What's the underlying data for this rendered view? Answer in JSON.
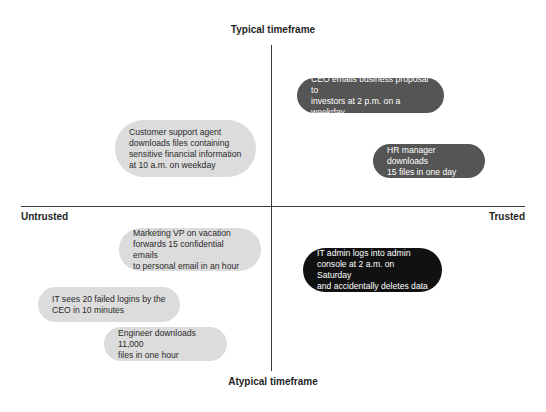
{
  "axes": {
    "top": "Typical timeframe",
    "bottom": "Atypical timeframe",
    "left": "Untrusted",
    "right": "Trusted"
  },
  "colors": {
    "light_pill": "#dcdcdc",
    "mid_pill": "#555555",
    "dark_pill": "#111111",
    "axis_line": "#3a3a3a"
  },
  "items": [
    {
      "text": "CEO emails business proposal to\ninvestors at 2 p.m. on a weekday",
      "quadrant": "typical-trusted",
      "shade": "mid"
    },
    {
      "text": "Customer support agent\ndownloads files containing\nsensitive financial information\nat 10 a.m. on weekday",
      "quadrant": "typical-untrusted",
      "shade": "light"
    },
    {
      "text": "HR manager downloads\n15 files in one day",
      "quadrant": "typical-trusted",
      "shade": "mid"
    },
    {
      "text": "Marketing VP on vacation\nforwards 15 confidential emails\nto personal email in an hour",
      "quadrant": "atypical-untrusted",
      "shade": "light"
    },
    {
      "text": "IT admin logs into admin\nconsole at 2 a.m. on Saturday\nand accidentally deletes data",
      "quadrant": "atypical-trusted",
      "shade": "dark"
    },
    {
      "text": "IT sees 20 failed logins by the\nCEO in 10 minutes",
      "quadrant": "atypical-untrusted",
      "shade": "light"
    },
    {
      "text": "Engineer downloads 11,000\nfiles in one hour",
      "quadrant": "atypical-untrusted",
      "shade": "light"
    }
  ]
}
